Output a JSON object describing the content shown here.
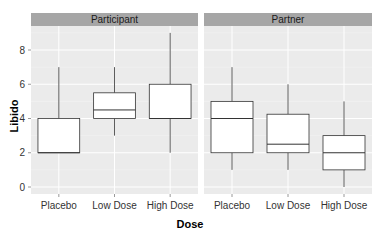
{
  "chart_data": {
    "type": "boxplot",
    "title": "",
    "xlabel": "Dose",
    "ylabel": "Libido",
    "ylim": [
      -0.4,
      9.4
    ],
    "yticks": [
      0,
      2,
      4,
      6,
      8
    ],
    "grid": true,
    "facets": [
      "Participant",
      "Partner"
    ],
    "categories": [
      "Placebo",
      "Low Dose",
      "High Dose"
    ],
    "series": [
      {
        "name": "Participant",
        "boxes": [
          {
            "category": "Placebo",
            "min": 2,
            "q1": 2,
            "median": 2,
            "q3": 4,
            "max": 7
          },
          {
            "category": "Low Dose",
            "min": 3,
            "q1": 4,
            "median": 4.5,
            "q3": 5.5,
            "max": 7
          },
          {
            "category": "High Dose",
            "min": 2,
            "q1": 4,
            "median": 4,
            "q3": 6,
            "max": 9
          }
        ]
      },
      {
        "name": "Partner",
        "boxes": [
          {
            "category": "Placebo",
            "min": 1,
            "q1": 2,
            "median": 4,
            "q3": 5,
            "max": 7
          },
          {
            "category": "Low Dose",
            "min": 1,
            "q1": 2,
            "median": 2.5,
            "q3": 4.25,
            "max": 6
          },
          {
            "category": "High Dose",
            "min": 0,
            "q1": 1,
            "median": 2,
            "q3": 3,
            "max": 5
          }
        ]
      }
    ]
  },
  "colors": {
    "panel_bg": "#ebebeb",
    "strip_bg": "#a6a6a6",
    "grid_major": "#ffffff",
    "grid_minor": "#f4f4f4",
    "box_fill": "#ffffff",
    "box_stroke": "#333333"
  }
}
